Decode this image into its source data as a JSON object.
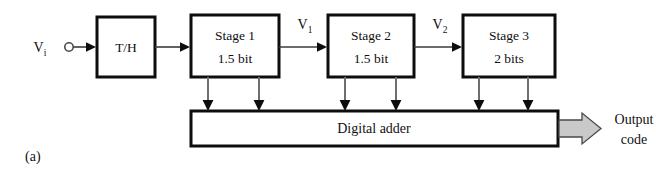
{
  "figure": {
    "caption": "(a)",
    "type": "pipelined-adc-block-diagram"
  },
  "input": {
    "signal_label": "V",
    "signal_subscript": "i",
    "node_icon": "open-circle-terminal-icon"
  },
  "blocks": [
    {
      "id": "th",
      "line1": "T/H",
      "line2": ""
    },
    {
      "id": "stage1",
      "line1": "Stage 1",
      "line2": "1.5 bit"
    },
    {
      "id": "stage2",
      "line1": "Stage 2",
      "line2": "1.5 bit"
    },
    {
      "id": "stage3",
      "line1": "Stage 3",
      "line2": "2 bits"
    }
  ],
  "interstage_signals": [
    {
      "id": "v1",
      "label": "V",
      "subscript": "1"
    },
    {
      "id": "v2",
      "label": "V",
      "subscript": "2"
    }
  ],
  "adder": {
    "label": "Digital adder"
  },
  "output": {
    "line1": "Output",
    "line2": "code",
    "arrow_icon": "block-arrow-right-icon"
  },
  "colors": {
    "block_border": "#0d0d0d",
    "block_fill": "#ffffff",
    "wire": "#3a3a3a",
    "tap_wire": "#6e6e6e",
    "output_arrow_fill": "#c9c9c9",
    "background": "#ffffff",
    "text": "#101010"
  }
}
